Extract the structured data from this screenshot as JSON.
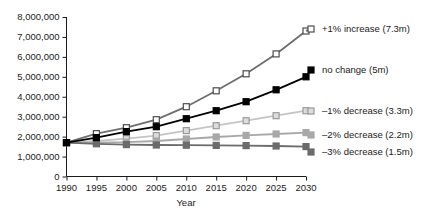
{
  "chart_data": {
    "type": "line",
    "title": "",
    "xlabel": "Year",
    "ylabel": "",
    "x": [
      1990,
      1995,
      2000,
      2005,
      2010,
      2015,
      2020,
      2025,
      2030
    ],
    "xtick_labels": [
      "1990",
      "1995",
      "2000",
      "2005",
      "2010",
      "2015",
      "2020",
      "2025",
      "2030"
    ],
    "ytick_labels": [
      "0",
      "1,000,000",
      "2,000,000",
      "3,000,000",
      "4,000,000",
      "5,000,000",
      "6,000,000",
      "7,000,000",
      "8,000,000"
    ],
    "ytick_values": [
      0,
      1000000,
      2000000,
      3000000,
      4000000,
      5000000,
      6000000,
      7000000,
      8000000
    ],
    "xlim": [
      1990,
      2030
    ],
    "ylim": [
      0,
      8000000
    ],
    "grid": false,
    "legend_position": "right",
    "series": [
      {
        "name": "+1% increase (7.3m)",
        "label": "+1% increase (7.3m)",
        "marker": "open-square",
        "line_color": "#6e6e6e",
        "marker_fill": "#ffffff",
        "marker_stroke": "#4d4d4d",
        "values": [
          1700000,
          2150000,
          2450000,
          2850000,
          3500000,
          4300000,
          5150000,
          6150000,
          7300000
        ]
      },
      {
        "name": "no change (5m)",
        "label": "no change (5m)",
        "marker": "filled-square",
        "line_color": "#000000",
        "marker_fill": "#000000",
        "marker_stroke": "#000000",
        "values": [
          1700000,
          1950000,
          2250000,
          2500000,
          2900000,
          3300000,
          3750000,
          4350000,
          5000000
        ]
      },
      {
        "name": "-1% decrease (3.3m)",
        "label": "–1% decrease (3.3m)",
        "marker": "open-square",
        "line_color": "#c4c4c4",
        "marker_fill": "#dcdcdc",
        "marker_stroke": "#9a9a9a",
        "values": [
          1700000,
          1780000,
          1900000,
          2050000,
          2300000,
          2550000,
          2800000,
          3050000,
          3300000
        ]
      },
      {
        "name": "-2% decrease (2.2m)",
        "label": "–2% decrease (2.2m)",
        "marker": "filled-square",
        "line_color": "#a8a8a8",
        "marker_fill": "#a8a8a8",
        "marker_stroke": "#a8a8a8",
        "values": [
          1700000,
          1700000,
          1720000,
          1780000,
          1880000,
          1980000,
          2060000,
          2130000,
          2200000
        ]
      },
      {
        "name": "-3% decrease (1.5m)",
        "label": "–3% decrease (1.5m)",
        "marker": "filled-square",
        "line_color": "#6b6b6b",
        "marker_fill": "#6b6b6b",
        "marker_stroke": "#6b6b6b",
        "values": [
          1700000,
          1640000,
          1600000,
          1580000,
          1570000,
          1560000,
          1550000,
          1530000,
          1500000
        ]
      }
    ]
  },
  "legend": {
    "items": [
      {
        "label": "+1% increase (7.3m)"
      },
      {
        "label": "no change (5m)"
      },
      {
        "label": "–1% decrease (3.3m)"
      },
      {
        "label": "–2% decrease (2.2m)"
      },
      {
        "label": "–3% decrease (1.5m)"
      }
    ]
  },
  "axes": {
    "x_title": "Year"
  }
}
